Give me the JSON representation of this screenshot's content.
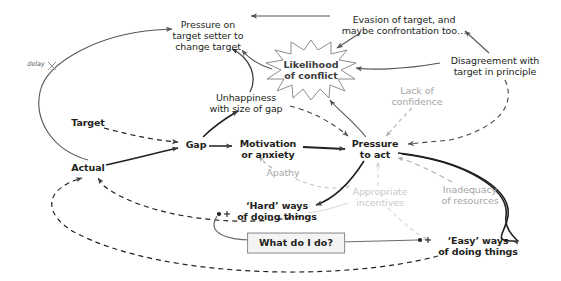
{
  "diagram": {
    "canvas": {
      "width": 561,
      "height": 281,
      "background": "#ffffff"
    },
    "colors": {
      "ink": "#231f20",
      "line_dark": "#3d3d3d",
      "line_mid": "#6b6b6b",
      "faded": "#a6a6a6",
      "faded_light": "#c9c9c9",
      "box_fill": "#f4f4f4",
      "box_border": "#8a8a8a"
    },
    "nodes": [
      {
        "id": "pressure-on-target-setter",
        "label": "Pressure on\ntarget setter to\nchange target",
        "x": 208,
        "y": 36,
        "style": "plain"
      },
      {
        "id": "evasion-of-target",
        "label": "Evasion of target, and\nmaybe confrontation too…",
        "x": 404,
        "y": 25,
        "style": "plain"
      },
      {
        "id": "disagreement-with-target",
        "label": "Disagreement with\ntarget in principle",
        "x": 495,
        "y": 66,
        "style": "plain"
      },
      {
        "id": "likelihood-of-conflict",
        "label": "Likelihood\nof conflict",
        "x": 311,
        "y": 70,
        "style": "burst"
      },
      {
        "id": "unhappiness-with-size-of-gap",
        "label": "Unhappiness\nwith size of gap",
        "x": 246,
        "y": 103,
        "style": "plain"
      },
      {
        "id": "lack-of-confidence",
        "label": "Lack of\nconfidence",
        "x": 417,
        "y": 96,
        "style": "fade1"
      },
      {
        "id": "target",
        "label": "Target",
        "x": 88,
        "y": 123,
        "style": "strong"
      },
      {
        "id": "gap",
        "label": "Gap",
        "x": 196,
        "y": 145,
        "style": "strong"
      },
      {
        "id": "motivation-or-anxiety",
        "label": "Motivation\nor anxiety",
        "x": 268,
        "y": 149,
        "style": "strong"
      },
      {
        "id": "pressure-to-act",
        "label": "Pressure\nto act",
        "x": 375,
        "y": 149,
        "style": "strong"
      },
      {
        "id": "actual",
        "label": "Actual",
        "x": 88,
        "y": 168,
        "style": "strong"
      },
      {
        "id": "apathy",
        "label": "Apathy",
        "x": 283,
        "y": 173,
        "style": "fade1"
      },
      {
        "id": "inadequacy-of-resources",
        "label": "Inadequacy\nof resources",
        "x": 470,
        "y": 195,
        "style": "fade1"
      },
      {
        "id": "appropriate-incentives",
        "label": "Appropriate\nincentives",
        "x": 380,
        "y": 197,
        "style": "fade2"
      },
      {
        "id": "hard-ways-of-doing-things",
        "label": "‘Hard’ ways\nof doing things",
        "x": 277,
        "y": 211,
        "style": "strong"
      },
      {
        "id": "easy-ways-of-doing-things",
        "label": "‘Easy’ ways\nof doing things",
        "x": 478,
        "y": 246,
        "style": "strong"
      },
      {
        "id": "what-do-i-do",
        "label": "What do I do?",
        "x": 296,
        "y": 243,
        "style": "box"
      }
    ],
    "annotations": [
      {
        "id": "delay-label",
        "label": "delay",
        "x": 36,
        "y": 65
      }
    ],
    "junction_markers": [
      {
        "id": "hard-ways-junction",
        "x": 221,
        "y": 214
      },
      {
        "id": "easy-ways-junction",
        "x": 422,
        "y": 240
      }
    ],
    "links": [
      {
        "from": "actual",
        "to": "pressure-on-target-setter",
        "style": "solid",
        "label": "delay"
      },
      {
        "from": "unhappiness-with-size-of-gap",
        "to": "pressure-on-target-setter",
        "style": "solid"
      },
      {
        "from": "likelihood-of-conflict",
        "to": "pressure-on-target-setter",
        "style": "solid"
      },
      {
        "from": "evasion-of-target",
        "to": "pressure-on-target-setter",
        "style": "solid"
      },
      {
        "from": "evasion-of-target",
        "to": "likelihood-of-conflict",
        "style": "solid"
      },
      {
        "from": "disagreement-with-target",
        "to": "evasion-of-target",
        "style": "solid"
      },
      {
        "from": "disagreement-with-target",
        "to": "likelihood-of-conflict",
        "style": "solid"
      },
      {
        "from": "disagreement-with-target",
        "to": "pressure-to-act",
        "style": "dashed"
      },
      {
        "from": "pressure-to-act",
        "to": "likelihood-of-conflict",
        "style": "solid"
      },
      {
        "from": "unhappiness-with-size-of-gap",
        "to": "pressure-to-act",
        "style": "dashed"
      },
      {
        "from": "lack-of-confidence",
        "to": "pressure-to-act",
        "style": "dashed",
        "fade": "fade1"
      },
      {
        "from": "gap",
        "to": "unhappiness-with-size-of-gap",
        "style": "solid"
      },
      {
        "from": "target",
        "to": "gap",
        "style": "dashed"
      },
      {
        "from": "actual",
        "to": "gap",
        "style": "solid"
      },
      {
        "from": "gap",
        "to": "motivation-or-anxiety",
        "style": "solid"
      },
      {
        "from": "motivation-or-anxiety",
        "to": "pressure-to-act",
        "style": "solid"
      },
      {
        "from": "apathy",
        "to": "motivation-or-anxiety",
        "style": "dashed",
        "fade": "fade1"
      },
      {
        "from": "apathy",
        "to": "pressure-to-act",
        "style": "dashed",
        "fade": "fade1"
      },
      {
        "from": "pressure-to-act",
        "to": "hard-ways-of-doing-things",
        "style": "solid"
      },
      {
        "from": "pressure-to-act",
        "to": "easy-ways-of-doing-things",
        "style": "solid"
      },
      {
        "from": "appropriate-incentives",
        "to": "pressure-to-act",
        "style": "dashed",
        "fade": "fade2"
      },
      {
        "from": "appropriate-incentives",
        "to": "hard-ways-of-doing-things",
        "style": "dashed",
        "fade": "fade2"
      },
      {
        "from": "appropriate-incentives",
        "to": "easy-ways-of-doing-things",
        "style": "dashed",
        "fade": "fade2"
      },
      {
        "from": "inadequacy-of-resources",
        "to": "pressure-to-act",
        "style": "dashed",
        "fade": "fade1"
      },
      {
        "from": "hard-ways-of-doing-things",
        "to": "actual",
        "style": "dashed"
      },
      {
        "from": "easy-ways-of-doing-things",
        "to": "actual",
        "style": "dashed"
      },
      {
        "from": "what-do-i-do",
        "to": "hard-ways-junction",
        "style": "solid"
      },
      {
        "from": "what-do-i-do",
        "to": "easy-ways-junction",
        "style": "solid"
      }
    ]
  }
}
